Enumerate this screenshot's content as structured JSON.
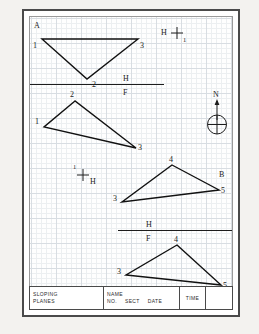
{
  "sheet": {
    "corner_label": "A",
    "side_label": "B"
  },
  "title_block": {
    "subject_line1": "SLOPING",
    "subject_line2": "PLANES",
    "name_label": "NAME",
    "no_label": "NO.",
    "sect_label": "SECT",
    "date_label": "DATE",
    "time_label": "TIME"
  },
  "colors": {
    "ink": "#111111",
    "grid_minor": "#eceff1",
    "grid_major": "#d8dde2",
    "frame": "#4a4a4a",
    "page": "#f3f2ef"
  },
  "fold_lines": [
    {
      "name": "upper-fold-line",
      "top_label": "H",
      "bottom_label": "F"
    },
    {
      "name": "lower-fold-line",
      "top_label": "H",
      "bottom_label": "F"
    }
  ],
  "reference_marks": [
    {
      "name": "h1-crosshair-top-right",
      "left_label": "H",
      "corner_label": "1"
    },
    {
      "name": "h1-crosshair-middle",
      "left_label": "1",
      "corner_label": "H"
    }
  ],
  "compass": {
    "label": "N"
  },
  "figures": [
    {
      "name": "triangle-top-horizontal-view",
      "vertices": [
        {
          "id": "1",
          "x": 12,
          "y": 22
        },
        {
          "id": "3",
          "x": 108,
          "y": 22
        },
        {
          "id": "2",
          "x": 57,
          "y": 62
        }
      ]
    },
    {
      "name": "triangle-upper-frontal-view",
      "vertices": [
        {
          "id": "2",
          "x": 45,
          "y": 84
        },
        {
          "id": "1",
          "x": 14,
          "y": 110
        },
        {
          "id": "3",
          "x": 106,
          "y": 131
        }
      ]
    },
    {
      "name": "triangle-lower-horizontal-view",
      "vertices": [
        {
          "id": "4",
          "x": 142,
          "y": 148
        },
        {
          "id": "5",
          "x": 189,
          "y": 173
        },
        {
          "id": "3",
          "x": 92,
          "y": 185
        }
      ]
    },
    {
      "name": "triangle-lower-frontal-view",
      "vertices": [
        {
          "id": "4",
          "x": 147,
          "y": 228
        },
        {
          "id": "5",
          "x": 191,
          "y": 268
        },
        {
          "id": "3",
          "x": 96,
          "y": 258
        }
      ]
    }
  ]
}
